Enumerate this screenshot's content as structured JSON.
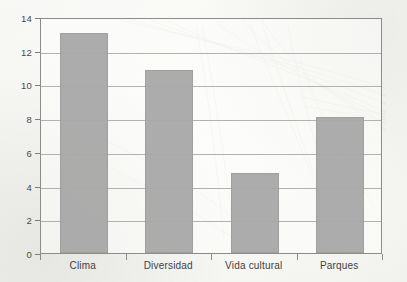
{
  "chart_data": {
    "type": "bar",
    "title": "",
    "subtitle": "",
    "xlabel": "",
    "ylabel": "",
    "categories": [
      "Clima",
      "Diversidad",
      "Vida cultural",
      "Parques"
    ],
    "values": [
      13.05,
      10.85,
      4.75,
      8.05
    ],
    "ylim": [
      0,
      14
    ],
    "ytick_values": [
      0,
      2,
      4,
      6,
      8,
      10,
      12,
      14
    ],
    "ytick_labels": [
      "0",
      "2",
      "4",
      "6",
      "8",
      "10",
      "12",
      "14"
    ],
    "grid": "horizontal",
    "legend": "none",
    "bar_color": "#a9a9a9",
    "grid_color": "#9a9a9a",
    "frame_color": "#8c8c8c",
    "background_color": "#f8f8f6",
    "text_color": "#3f3f3f"
  }
}
